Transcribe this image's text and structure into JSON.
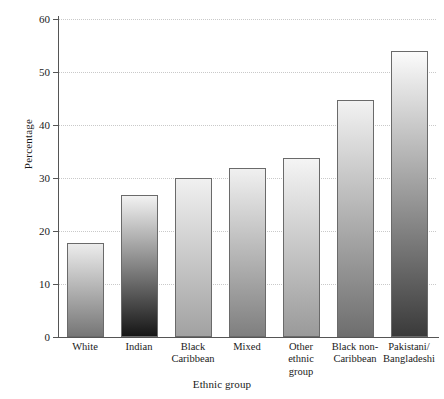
{
  "chart_data": {
    "type": "bar",
    "title": "",
    "xlabel": "Ethnic group",
    "ylabel": "Percentage",
    "categories": [
      "White",
      "Indian",
      "Black Caribbean",
      "Mixed",
      "Other ethnic group",
      "Black non-Caribbean",
      "Pakistani/ Bangladeshi"
    ],
    "category_lines": [
      [
        "White"
      ],
      [
        "Indian"
      ],
      [
        "Black",
        "Caribbean"
      ],
      [
        "Mixed"
      ],
      [
        "Other",
        "ethnic",
        "group"
      ],
      [
        "Black non-",
        "Caribbean"
      ],
      [
        "Pakistani/",
        "Bangladeshi"
      ]
    ],
    "values": [
      17.8,
      26.8,
      30.0,
      31.8,
      33.8,
      44.7,
      54.0
    ],
    "ylim": [
      0,
      60
    ],
    "ytick_values": [
      0,
      10,
      20,
      30,
      40,
      50,
      60
    ],
    "ytick_labels": [
      "0",
      "10",
      "20",
      "30",
      "40",
      "50",
      "60"
    ],
    "grid": true,
    "grid_axis": "y",
    "legend": "none",
    "bar_colors": [
      {
        "top": "#ececec",
        "bottom": "#767676"
      },
      {
        "top": "#f2f2f2",
        "bottom": "#161616"
      },
      {
        "top": "#f0f0f0",
        "bottom": "#a2a2a2"
      },
      {
        "top": "#f0f0f0",
        "bottom": "#7f7f7f"
      },
      {
        "top": "#f4f4f4",
        "bottom": "#9a9a9a"
      },
      {
        "top": "#f2f2f2",
        "bottom": "#6e6e6e"
      },
      {
        "top": "#fbfbfb",
        "bottom": "#3a3a3a"
      }
    ],
    "bar_border_color": "#6a6a6a",
    "axis_color": "#555555",
    "grid_color": "#c9c9c9",
    "background_color": "#ffffff"
  }
}
